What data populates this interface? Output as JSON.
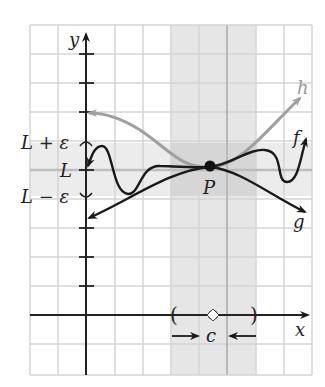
{
  "figure": {
    "axes": {
      "x_label": "x",
      "y_label": "y"
    },
    "labels": {
      "L_plus_eps": "L + ε",
      "L": "L",
      "L_minus_eps": "L − ε",
      "point": "P",
      "c": "c",
      "h": "h",
      "f": "f",
      "g": "g"
    },
    "colors": {
      "grid": "#d4d4d4",
      "band": "#e8e8e8",
      "band_overlap": "#d2d2d2",
      "axis": "#222222",
      "curve_f": "#1a1a1a",
      "curve_g": "#1a1a1a",
      "curve_h": "#a0a0a0",
      "center_line": "#b8b8b8"
    },
    "interval_marks": {
      "left": "(",
      "right": ")"
    }
  }
}
